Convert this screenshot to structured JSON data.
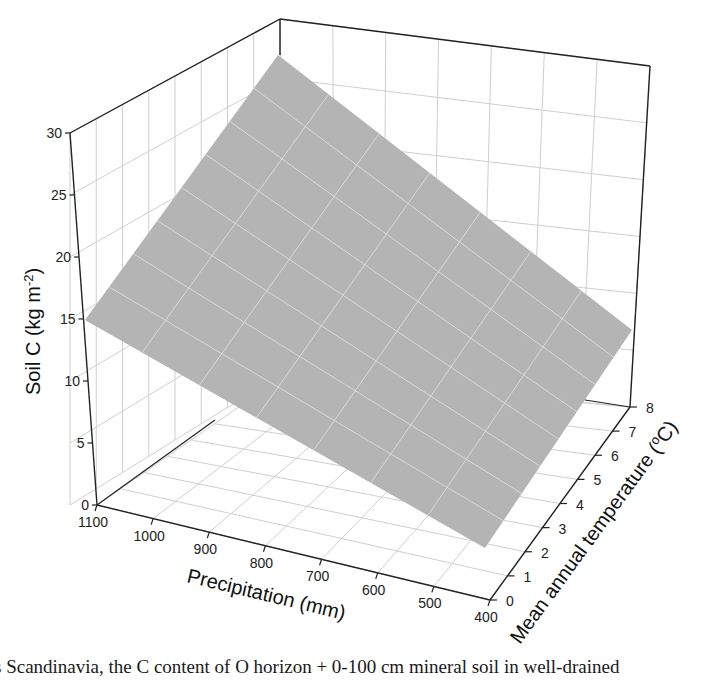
{
  "chart_data": {
    "type": "surface3d",
    "title": "",
    "xlabel": "Precipitation (mm)",
    "ylabel": "Mean annual temperature (°C)",
    "zlabel": "Soil C (kg m⁻²)",
    "x_ticks": [
      1100,
      1000,
      900,
      800,
      700,
      600,
      500,
      400
    ],
    "y_ticks": [
      0,
      1,
      2,
      3,
      4,
      5,
      6,
      7,
      8
    ],
    "z_ticks": [
      0,
      5,
      10,
      15,
      20,
      25,
      30
    ],
    "xlim": [
      400,
      1100
    ],
    "ylim": [
      0,
      8
    ],
    "zlim": [
      0,
      30
    ],
    "grid": true,
    "surface_corners": [
      {
        "precipitation": 1100,
        "temperature": 0,
        "soil_c": 15.5
      },
      {
        "precipitation": 1100,
        "temperature": 8,
        "soil_c": 29.5
      },
      {
        "precipitation": 400,
        "temperature": 0,
        "soil_c": 3.5
      },
      {
        "precipitation": 400,
        "temperature": 8,
        "soil_c": 11.5
      }
    ],
    "surface_color": "#b4b4b4"
  },
  "labels": {
    "z_axis_title": "Soil C (kg m",
    "z_axis_sup": "-2",
    "z_axis_close": ")",
    "x_axis_title": "Precipitation  (mm)",
    "y_axis_title": "Mean annual temperature (",
    "y_axis_sup": "o",
    "y_axis_close": "C)"
  },
  "caption": "s Scandinavia, the C content of O horizon + 0-100 cm mineral soil in well-drained"
}
